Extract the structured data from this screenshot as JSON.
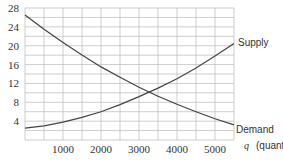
{
  "chart_data": {
    "type": "line",
    "title": "",
    "xlabel": "q (quantity)",
    "ylabel": "",
    "xlim": [
      0,
      5500
    ],
    "ylim": [
      0,
      28
    ],
    "grid": true,
    "x_ticks": [
      1000,
      2000,
      3000,
      4000,
      5000
    ],
    "y_ticks": [
      4,
      8,
      12,
      16,
      20,
      24,
      28
    ],
    "series": [
      {
        "name": "Supply",
        "x": [
          0,
          500,
          1000,
          1500,
          2000,
          2500,
          3000,
          3500,
          4000,
          4500,
          5000,
          5500
        ],
        "values": [
          2.5,
          3.0,
          3.8,
          4.8,
          6.0,
          7.5,
          9.2,
          11.0,
          13.0,
          15.3,
          17.8,
          20.5
        ]
      },
      {
        "name": "Demand",
        "x": [
          0,
          500,
          1000,
          1500,
          2000,
          2500,
          3000,
          3500,
          4000,
          4500,
          5000,
          5500
        ],
        "values": [
          26.5,
          23.5,
          20.7,
          18.0,
          15.5,
          13.3,
          11.2,
          9.3,
          7.6,
          6.0,
          4.5,
          3.2
        ]
      }
    ],
    "annotations": [
      "Supply",
      "Demand"
    ]
  },
  "labels": {
    "supply": "Supply",
    "demand": "Demand",
    "xaxis": "q (quantity)",
    "xaxis_q": "q",
    "xaxis_unit": "(quantity)"
  },
  "ticks": {
    "x": [
      "1000",
      "2000",
      "3000",
      "4000",
      "5000"
    ],
    "y": [
      "4",
      "8",
      "12",
      "16",
      "20",
      "24",
      "28"
    ]
  }
}
